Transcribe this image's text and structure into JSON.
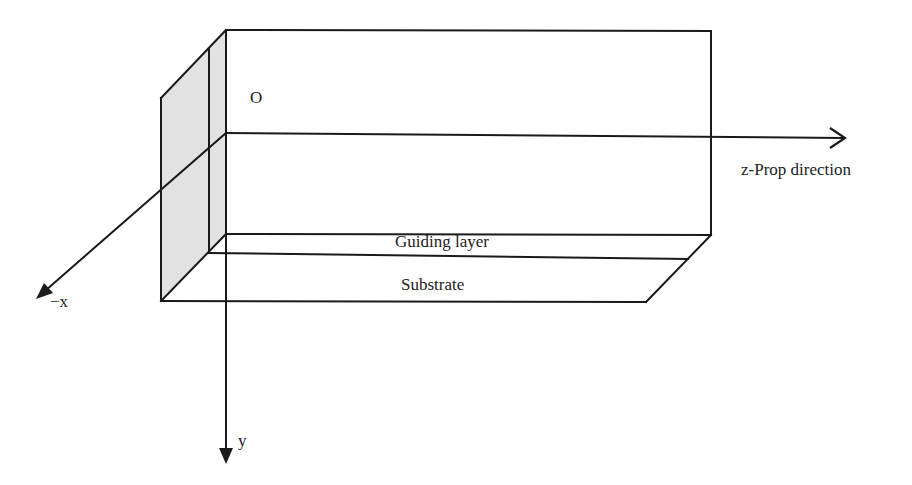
{
  "diagram": {
    "type": "waveguide-coordinate-schematic",
    "labels": {
      "origin": "O",
      "z_axis": "z-Prop direction",
      "x_axis": "−x",
      "y_axis": "y",
      "guiding_layer": "Guiding layer",
      "substrate": "Substrate"
    },
    "colors": {
      "line": "#1a1a1a",
      "panel_fill": "#e2e2e2",
      "background": "#ffffff"
    }
  }
}
